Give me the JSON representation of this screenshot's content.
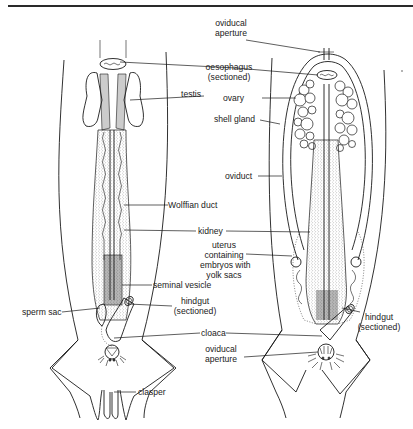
{
  "figure": {
    "type": "anatomical diagram",
    "panels": [
      {
        "name": "male",
        "labels": {
          "oesophagus": "oesophagus",
          "oesophagus_note": "(sectioned)",
          "testis": "testis",
          "wolffian_duct": "Wolffian duct",
          "kidney": "kidney",
          "seminal_vesicle": "seminal vesicle",
          "sperm_sac": "sperm sac",
          "hindgut": "hindgut",
          "hindgut_note": "(sectioned)",
          "cloaca": "cloaca",
          "clasper": "clasper"
        }
      },
      {
        "name": "female",
        "labels": {
          "oviducal_aperture_top_1": "oviducal",
          "oviducal_aperture_top_2": "aperture",
          "ovary": "ovary",
          "shell_gland": "shell gland",
          "oviduct": "oviduct",
          "uterus_1": "uterus",
          "uterus_2": "containing",
          "uterus_3": "embryos with",
          "uterus_4": "yolk sacs",
          "hindgut": "hindgut",
          "hindgut_note": "(sectioned)",
          "oviducal_aperture_bottom_1": "oviducal",
          "oviducal_aperture_bottom_2": "aperture"
        }
      }
    ],
    "colors": {
      "line": "#1a1a1a",
      "background": "#ffffff"
    }
  }
}
